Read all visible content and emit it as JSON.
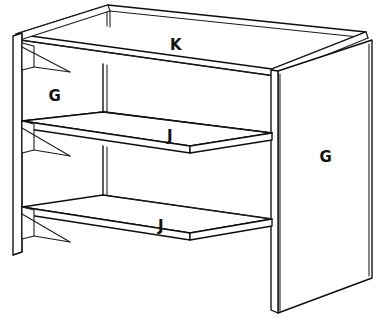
{
  "diagram": {
    "view": "perspective",
    "background_color": "#ffffff",
    "line_color": "#0d0d0d",
    "canvas": {
      "width": 383,
      "height": 332
    },
    "labels": [
      {
        "id": "label-k-top-panel",
        "text": "K",
        "x": 176,
        "y": 45,
        "part": "top panel"
      },
      {
        "id": "label-g-left-panel",
        "text": "G",
        "x": 55,
        "y": 96,
        "part": "left side panel"
      },
      {
        "id": "label-j-middle-shelf",
        "text": "J",
        "x": 170,
        "y": 136,
        "part": "middle shelf"
      },
      {
        "id": "label-g-right-panel",
        "text": "G",
        "x": 326,
        "y": 157,
        "part": "right side panel"
      },
      {
        "id": "label-j-bottom-shelf",
        "text": "J",
        "x": 161,
        "y": 226,
        "part": "bottom shelf"
      }
    ],
    "parts": [
      {
        "letter": "K",
        "name": "top panel",
        "quantity": 1
      },
      {
        "letter": "G",
        "name": "side panel",
        "quantity": 2
      },
      {
        "letter": "J",
        "name": "shelf",
        "quantity": 2
      }
    ]
  }
}
